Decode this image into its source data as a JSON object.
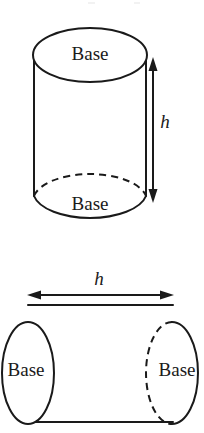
{
  "figure": {
    "background_color": "#ffffff",
    "stroke_color": "#1a1a1a",
    "fill_color": "#ffffff",
    "shapes": [
      {
        "id": "vertical-cylinder",
        "orientation": "vertical",
        "labels": {
          "top_base": "Base",
          "bottom_base": "Base",
          "height_dimension": "h"
        },
        "geometry": {
          "axis_x": 90,
          "top_ellipse_cy": 55,
          "bottom_ellipse_cy": 196,
          "ellipse_rx": 57,
          "ellipse_ry": 27,
          "wall_left_x": 34,
          "wall_right_x": 146,
          "dimension_arrow_x": 153,
          "dimension_arrow_y_top": 58,
          "dimension_arrow_y_bottom": 201,
          "hidden_edge_style": "dashed"
        }
      },
      {
        "id": "horizontal-cylinder",
        "orientation": "horizontal",
        "labels": {
          "left_base": "Base",
          "right_base": "Base",
          "height_dimension": "h"
        },
        "geometry": {
          "axis_y": 373,
          "left_ellipse_cx": 28,
          "right_ellipse_cx": 172,
          "ellipse_rx": 26,
          "ellipse_ry": 51,
          "wall_top_y": 305,
          "wall_bottom_y": 422,
          "dimension_arrow_y": 295,
          "dimension_arrow_x_left": 28,
          "dimension_arrow_x_right": 172,
          "hidden_edge_style": "dashed"
        }
      }
    ]
  },
  "labels": {
    "vertical": {
      "top_base": "Base",
      "bottom_base": "Base",
      "height": "h"
    },
    "horizontal": {
      "left_base": "Base",
      "right_base": "Base",
      "height": "h"
    }
  }
}
